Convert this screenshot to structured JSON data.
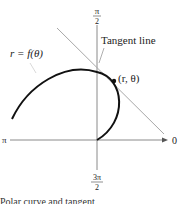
{
  "diagram": {
    "type": "polar-tangent-line",
    "labels": {
      "top_axis_num": "π",
      "top_axis_den": "2",
      "bottom_axis_num": "3π",
      "bottom_axis_den": "2",
      "left_axis": "π",
      "right_axis": "0",
      "curve": "r = f(θ)",
      "tangent": "Tangent line",
      "point": "(r, θ)"
    },
    "caption": "Polar curve and tangent",
    "colors": {
      "curve": "#111111",
      "axes": "#8a8a8a",
      "tangent": "#a8a8a8",
      "text": "#222222"
    }
  }
}
